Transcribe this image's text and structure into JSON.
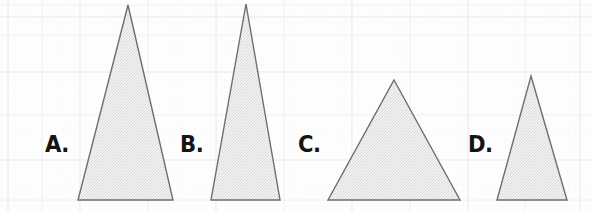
{
  "page": {
    "width": 592,
    "height": 212,
    "background_color": "#fdfdfd"
  },
  "paper": {
    "grid_line_color": "#eef0f2",
    "grid_line_color_strong": "#e6e9ec",
    "grid_spacing_x": 68,
    "grid_spacing_y": 45,
    "vertical_lines_x": [
      8,
      42,
      80,
      148,
      216,
      284,
      352,
      410,
      468,
      525,
      580
    ],
    "horizontal_lines_y": [
      5,
      17,
      35,
      72,
      115,
      160,
      200
    ]
  },
  "shapes": {
    "fill_color": "#ececec",
    "stroke_color": "#6e6e6e",
    "stroke_width": 1.4,
    "items": [
      {
        "id": "triangle-a",
        "label": "A.",
        "label_x": 45,
        "label_baseline_y": 155,
        "apex_x": 128,
        "apex_y": 5,
        "base_left_x": 78,
        "base_right_x": 173,
        "base_y": 200,
        "width": 95,
        "height": 195,
        "description": "tall narrow triangle"
      },
      {
        "id": "triangle-b",
        "label": "B.",
        "label_x": 180,
        "label_baseline_y": 155,
        "apex_x": 246,
        "apex_y": 4,
        "base_left_x": 211,
        "base_right_x": 280,
        "base_y": 200,
        "width": 69,
        "height": 196,
        "description": "tallest narrowest triangle"
      },
      {
        "id": "triangle-c",
        "label": "C.",
        "label_x": 298,
        "label_baseline_y": 155,
        "apex_x": 394,
        "apex_y": 80,
        "base_left_x": 328,
        "base_right_x": 460,
        "base_y": 200,
        "width": 132,
        "height": 120,
        "description": "wide short triangle"
      },
      {
        "id": "triangle-d",
        "label": "D.",
        "label_x": 468,
        "label_baseline_y": 155,
        "apex_x": 531,
        "apex_y": 76,
        "base_left_x": 497,
        "base_right_x": 567,
        "base_y": 200,
        "width": 70,
        "height": 124,
        "description": "small narrow triangle"
      }
    ]
  }
}
